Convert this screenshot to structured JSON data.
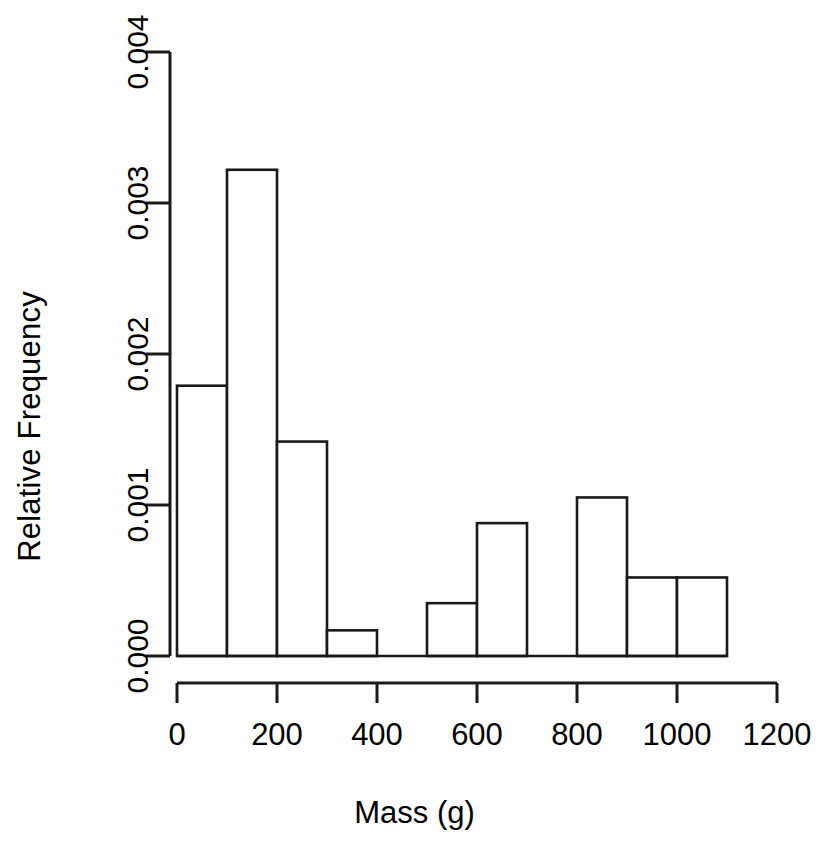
{
  "chart_data": {
    "type": "bar",
    "title": "",
    "subtitle": "",
    "xlabel": "Mass (g)",
    "ylabel": "Relative Frequency",
    "xlim": [
      0,
      1200
    ],
    "ylim": [
      0.0,
      0.004
    ],
    "grid": false,
    "legend": null,
    "bin_width": 100,
    "bin_edges": [
      0,
      100,
      200,
      300,
      400,
      500,
      600,
      700,
      800,
      900,
      1000,
      1100
    ],
    "categories": [
      "0-100",
      "100-200",
      "200-300",
      "300-400",
      "400-500",
      "500-600",
      "600-700",
      "700-800",
      "800-900",
      "900-1000",
      "1000-1100"
    ],
    "values": [
      0.00179,
      0.00322,
      0.00142,
      0.00017,
      0.0,
      0.00035,
      0.00088,
      0.0,
      0.00105,
      0.00052,
      0.00052
    ],
    "xticks": [
      {
        "value": 0,
        "label": "0"
      },
      {
        "value": 200,
        "label": "200"
      },
      {
        "value": 400,
        "label": "400"
      },
      {
        "value": 600,
        "label": "600"
      },
      {
        "value": 800,
        "label": "800"
      },
      {
        "value": 1000,
        "label": "1000"
      },
      {
        "value": 1200,
        "label": "1200"
      }
    ],
    "yticks": [
      {
        "value": 0.0,
        "label": "0.000"
      },
      {
        "value": 0.001,
        "label": "0.001"
      },
      {
        "value": 0.002,
        "label": "0.002"
      },
      {
        "value": 0.003,
        "label": "0.003"
      },
      {
        "value": 0.004,
        "label": "0.004"
      }
    ],
    "colors": {
      "bar_fill": "#ffffff",
      "bar_stroke": "#1a1a1a",
      "axis": "#1a1a1a",
      "background": "#ffffff",
      "text": "#000000"
    }
  }
}
